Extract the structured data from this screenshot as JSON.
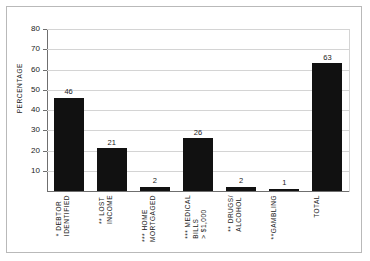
{
  "chart_data": {
    "type": "bar",
    "title": "",
    "xlabel": "",
    "ylabel": "PERCENTAGE",
    "ylim": [
      0,
      80
    ],
    "ytick_step": 10,
    "yticks": [
      80,
      70,
      60,
      50,
      40,
      30,
      20,
      10
    ],
    "grid": true,
    "legend": "none",
    "bar_color": "#111111",
    "categories": [
      "* DEBTOR\nIDENTIFIED",
      "** LOST\nINCOME",
      "*** HOME\nMORTGAGED",
      "*** MEDICAL\nBILLS\n> $1,000",
      "** DRUGS/\nALCOHOL",
      "**GAMBLING",
      "TOTAL"
    ],
    "values": [
      46,
      21,
      2,
      26,
      2,
      1,
      63
    ],
    "value_labels": [
      "46",
      "21",
      "2",
      "26",
      "2",
      "1",
      "63"
    ]
  },
  "axis": {
    "y_title": "PERCENTAGE",
    "ticks": [
      {
        "label": "80"
      },
      {
        "label": "70"
      },
      {
        "label": "60"
      },
      {
        "label": "50"
      },
      {
        "label": "40"
      },
      {
        "label": "30"
      },
      {
        "label": "20"
      },
      {
        "label": "10"
      }
    ]
  },
  "bars": [
    {
      "label": "* DEBTOR\nIDENTIFIED",
      "value": "46"
    },
    {
      "label": "** LOST\nINCOME",
      "value": "21"
    },
    {
      "label": "*** HOME\nMORTGAGED",
      "value": "2"
    },
    {
      "label": "*** MEDICAL\nBILLS\n> $1,000",
      "value": "26"
    },
    {
      "label": "** DRUGS/\nALCOHOL",
      "value": "2"
    },
    {
      "label": "**GAMBLING",
      "value": "1"
    },
    {
      "label": "TOTAL",
      "value": "63"
    }
  ]
}
